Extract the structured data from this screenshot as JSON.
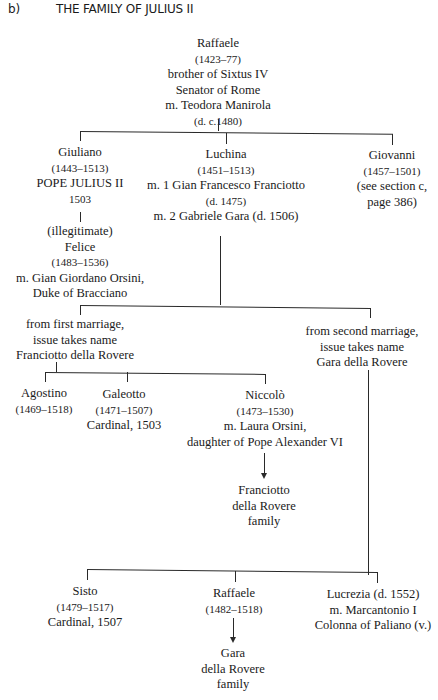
{
  "header": {
    "section_label": "b)",
    "title": "THE FAMILY OF JULIUS II"
  },
  "tree": {
    "raffaele_sr": {
      "name": "Raffaele",
      "dates": "(1423–77)",
      "note1": "brother of Sixtus IV",
      "note2": "Senator of Rome",
      "spouse": "m. Teodora Manirola",
      "spouse_dates": "(d. c.1480)"
    },
    "giuliano": {
      "name": "Giuliano",
      "dates": "(1443–1513)",
      "title": "POPE JULIUS II",
      "year": "1503"
    },
    "felice": {
      "qualifier": "(illegitimate)",
      "name": "Felice",
      "dates": "(1483–1536)",
      "spouse": "m. Gian Giordano Orsini,",
      "spouse_title": "Duke of Bracciano"
    },
    "luchina": {
      "name": "Luchina",
      "dates": "(1451–1513)",
      "marriage1": "m. 1 Gian Francesco Franciotto",
      "marriage1_dates": "(d. 1475)",
      "marriage2": "m. 2 Gabriele Gara (d. 1506)"
    },
    "giovanni": {
      "name": "Giovanni",
      "dates": "(1457–1501)",
      "note1": "(see section c,",
      "note2": "page 386)"
    },
    "first_marriage": {
      "line1": "from first marriage,",
      "line2": "issue takes name",
      "line3": "Franciotto della Rovere"
    },
    "second_marriage": {
      "line1": "from second marriage,",
      "line2": "issue takes name",
      "line3": "Gara della Rovere"
    },
    "agostino": {
      "name": "Agostino",
      "dates": "(1469–1518)"
    },
    "galeotto": {
      "name": "Galeotto",
      "dates": "(1471–1507)",
      "title": "Cardinal, 1503"
    },
    "niccolo": {
      "name": "Niccolò",
      "dates": "(1473–1530)",
      "spouse": "m. Laura Orsini,",
      "spouse_note": "daughter of Pope Alexander VI"
    },
    "franciotto_family": {
      "line1": "Franciotto",
      "line2": "della Rovere",
      "line3": "family"
    },
    "sisto": {
      "name": "Sisto",
      "dates": "(1479–1517)",
      "title": "Cardinal, 1507"
    },
    "raffaele_jr": {
      "name": "Raffaele",
      "dates": "(1482–1518)"
    },
    "lucrezia": {
      "name": "Lucrezia (d. 1552)",
      "spouse": "m. Marcantonio I",
      "spouse2": "Colonna of Paliano (v.)"
    },
    "gara_family": {
      "line1": "Gara",
      "line2": "della Rovere",
      "line3": "family"
    }
  }
}
